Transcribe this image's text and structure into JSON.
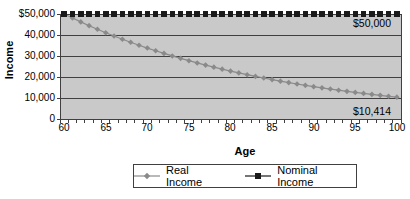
{
  "colors": {
    "background": "#ffffff",
    "plot_bg": "#c9c9c9",
    "gridline": "#404040",
    "axis": "#404040",
    "real_income": "#8a8a8a",
    "nominal_income": "#1a1a1a",
    "text": "#000000",
    "legend_border": "#404040"
  },
  "chart_data": {
    "type": "line",
    "title": "",
    "xlabel": "Age",
    "ylabel": "Income",
    "xlim": [
      60,
      100
    ],
    "ylim": [
      0,
      50000
    ],
    "grid": "horizontal",
    "legend_position": "bottom",
    "x": [
      60,
      61,
      62,
      63,
      64,
      65,
      66,
      67,
      68,
      69,
      70,
      71,
      72,
      73,
      74,
      75,
      76,
      77,
      78,
      79,
      80,
      81,
      82,
      83,
      84,
      85,
      86,
      87,
      88,
      89,
      90,
      91,
      92,
      93,
      94,
      95,
      96,
      97,
      98,
      99,
      100
    ],
    "series": [
      {
        "name": "Real Income",
        "marker": "diamond",
        "color": "#8a8a8a",
        "values": [
          50000,
          48077,
          46228,
          44450,
          42740,
          41096,
          39516,
          37996,
          36534,
          35129,
          33778,
          32479,
          31230,
          30029,
          28874,
          27763,
          26695,
          25669,
          24681,
          23732,
          22819,
          21942,
          21098,
          20286,
          19506,
          18756,
          18034,
          17341,
          16674,
          16033,
          15416,
          14823,
          14253,
          13705,
          13178,
          12671,
          12183,
          11715,
          11264,
          10831,
          10414
        ]
      },
      {
        "name": "Nominal Income",
        "marker": "square",
        "color": "#1a1a1a",
        "values": [
          50000,
          50000,
          50000,
          50000,
          50000,
          50000,
          50000,
          50000,
          50000,
          50000,
          50000,
          50000,
          50000,
          50000,
          50000,
          50000,
          50000,
          50000,
          50000,
          50000,
          50000,
          50000,
          50000,
          50000,
          50000,
          50000,
          50000,
          50000,
          50000,
          50000,
          50000,
          50000,
          50000,
          50000,
          50000,
          50000,
          50000,
          50000,
          50000,
          50000,
          50000
        ]
      }
    ],
    "ytick_values": [
      50000,
      40000,
      30000,
      20000,
      10000,
      0
    ],
    "ytick_labels": [
      "$50,000",
      "40,000",
      "30,000",
      "20,000",
      "10,000",
      "0"
    ],
    "xtick_labels": [
      "60",
      "65",
      "70",
      "75",
      "80",
      "85",
      "90",
      "95",
      "100"
    ],
    "annotations": [
      {
        "text": "$50,000",
        "series": "Nominal Income"
      },
      {
        "text": "$10,414",
        "series": "Real Income"
      }
    ]
  }
}
